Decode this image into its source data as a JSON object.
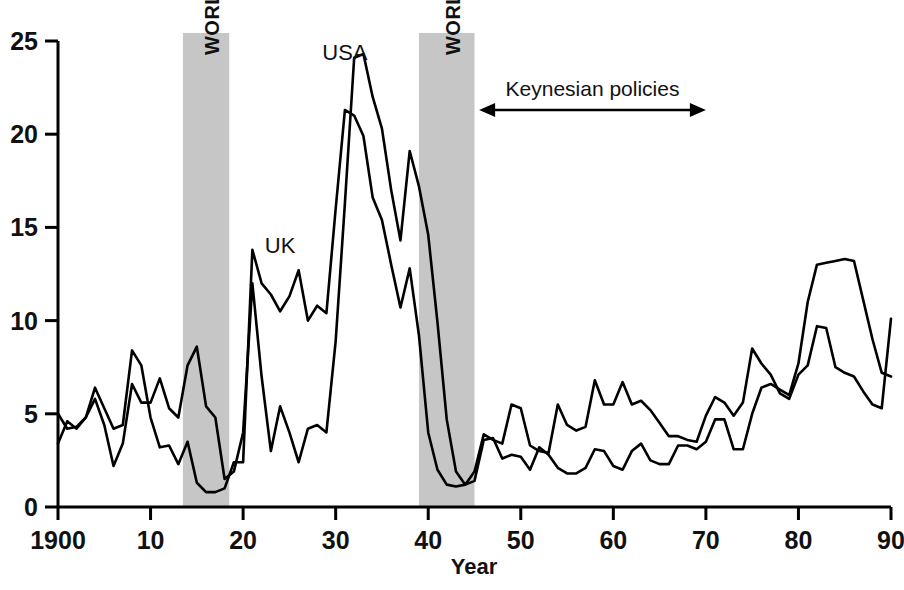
{
  "chart_data": {
    "type": "line",
    "title": "",
    "xlabel": "Year",
    "ylabel": "",
    "xlim": [
      1900,
      1990
    ],
    "ylim": [
      0,
      25
    ],
    "grid": false,
    "legend_position": "inline-annotations",
    "x_tick_labels": [
      "1900",
      "10",
      "20",
      "30",
      "40",
      "50",
      "60",
      "70",
      "80",
      "90"
    ],
    "x_tick_values": [
      1900,
      1910,
      1920,
      1930,
      1940,
      1950,
      1960,
      1970,
      1980,
      1990
    ],
    "y_tick_labels": [
      "0",
      "5",
      "10",
      "15",
      "20",
      "25"
    ],
    "y_tick_values": [
      0,
      5,
      10,
      15,
      20,
      25
    ],
    "x": [
      1900,
      1901,
      1902,
      1903,
      1904,
      1905,
      1906,
      1907,
      1908,
      1909,
      1910,
      1911,
      1912,
      1913,
      1914,
      1915,
      1916,
      1917,
      1918,
      1919,
      1920,
      1921,
      1922,
      1923,
      1924,
      1925,
      1926,
      1927,
      1928,
      1929,
      1930,
      1931,
      1932,
      1933,
      1934,
      1935,
      1936,
      1937,
      1938,
      1939,
      1940,
      1941,
      1942,
      1943,
      1944,
      1945,
      1946,
      1947,
      1948,
      1949,
      1950,
      1951,
      1952,
      1953,
      1954,
      1955,
      1956,
      1957,
      1958,
      1959,
      1960,
      1961,
      1962,
      1963,
      1964,
      1965,
      1966,
      1967,
      1968,
      1969,
      1970,
      1971,
      1972,
      1973,
      1974,
      1975,
      1976,
      1977,
      1978,
      1979,
      1980,
      1981,
      1982,
      1983,
      1984,
      1985,
      1986,
      1987,
      1988,
      1989,
      1990
    ],
    "series": [
      {
        "name": "UK",
        "color": "#000000",
        "values": [
          5.0,
          4.2,
          4.3,
          4.8,
          6.4,
          5.3,
          4.2,
          4.4,
          8.4,
          7.6,
          4.8,
          3.2,
          3.3,
          2.3,
          3.5,
          1.3,
          0.8,
          0.8,
          1.0,
          2.4,
          2.4,
          13.8,
          12.0,
          11.4,
          10.5,
          11.3,
          12.7,
          10.0,
          10.8,
          10.4,
          16.0,
          21.3,
          21.0,
          19.9,
          16.6,
          15.4,
          13.0,
          10.7,
          12.8,
          9.2,
          4.0,
          2.0,
          1.2,
          1.1,
          1.2,
          1.4,
          3.6,
          3.7,
          2.6,
          2.8,
          2.7,
          2.0,
          3.2,
          2.8,
          2.1,
          1.8,
          1.8,
          2.1,
          3.1,
          3.0,
          2.2,
          2.0,
          3.0,
          3.4,
          2.5,
          2.3,
          2.3,
          3.3,
          3.3,
          3.1,
          3.5,
          4.7,
          4.7,
          3.1,
          3.1,
          5.0,
          6.4,
          6.6,
          6.3,
          6.0,
          7.7,
          11.0,
          13.0,
          13.1,
          13.2,
          13.3,
          13.2,
          11.1,
          9.0,
          7.2,
          7.0
        ]
      },
      {
        "name": "USA",
        "color": "#000000",
        "values": [
          3.4,
          4.6,
          4.2,
          4.8,
          5.8,
          4.4,
          2.2,
          3.4,
          6.6,
          5.6,
          5.6,
          6.9,
          5.3,
          4.8,
          7.6,
          8.6,
          5.4,
          4.8,
          1.5,
          1.9,
          4.0,
          12.0,
          7.0,
          3.0,
          5.4,
          4.0,
          2.4,
          4.2,
          4.4,
          4.0,
          8.9,
          16.3,
          24.1,
          24.3,
          22.0,
          20.3,
          17.0,
          14.3,
          19.1,
          17.2,
          14.6,
          9.9,
          4.7,
          1.9,
          1.2,
          1.9,
          3.9,
          3.6,
          3.4,
          5.5,
          5.3,
          3.3,
          3.0,
          2.9,
          5.5,
          4.4,
          4.1,
          4.3,
          6.8,
          5.5,
          5.5,
          6.7,
          5.5,
          5.7,
          5.2,
          4.5,
          3.8,
          3.8,
          3.6,
          3.5,
          4.9,
          5.9,
          5.6,
          4.9,
          5.6,
          8.5,
          7.7,
          7.1,
          6.1,
          5.8,
          7.1,
          7.6,
          9.7,
          9.6,
          7.5,
          7.2,
          7.0,
          6.2,
          5.5,
          5.3,
          10.1
        ]
      }
    ],
    "shaded_bands": [
      {
        "label": "WORLD WAR ONE",
        "start": 1913.5,
        "end": 1918.5,
        "color": "#c6c6c6"
      },
      {
        "label": "WORLD WAR TWO",
        "start": 1939.0,
        "end": 1945.0,
        "color": "#c6c6c6"
      }
    ],
    "annotations": [
      {
        "name": "usa-series-label",
        "text": "USA",
        "x": 1931.0,
        "y": 24.0
      },
      {
        "name": "uk-series-label",
        "text": "UK",
        "x": 1924.0,
        "y": 13.6
      },
      {
        "name": "keynesian-policies-annotation",
        "text": "Keynesian policies",
        "start": 1945.5,
        "end": 1970.0,
        "y": 21.3,
        "arrow": "double-headed"
      }
    ]
  },
  "axes": {
    "x_title": "Year"
  },
  "colors": {
    "line": "#000000",
    "band": "#c6c6c6",
    "axis": "#000000",
    "background": "#ffffff"
  }
}
